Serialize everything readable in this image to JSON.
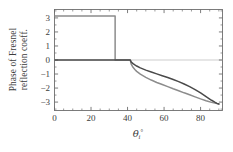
{
  "chart_data": {
    "type": "line",
    "title": "",
    "xlabel": "θᵢ°",
    "ylabel": "Phase of Fresnel reflection coeff.",
    "xlabel_parts": {
      "symbol": "θ",
      "subscript": "i",
      "superscript": "°"
    },
    "ylabel_line1": "Phase of Fresnel",
    "ylabel_line2": "reflection coeff.",
    "xlim": [
      0,
      92
    ],
    "ylim": [
      -3.6,
      3.6
    ],
    "xticks": [
      0,
      20,
      40,
      60,
      80
    ],
    "xtick_labels": [
      "0",
      "20",
      "40",
      "60",
      "80"
    ],
    "xticks_minor": [
      5,
      10,
      15,
      25,
      30,
      35,
      45,
      50,
      55,
      65,
      70,
      75,
      85,
      90
    ],
    "yticks": [
      3,
      2,
      1,
      0,
      -1,
      -2,
      -3
    ],
    "ytick_labels": [
      "3",
      "2",
      "1",
      "0",
      "−1",
      "−2",
      "−3"
    ],
    "yticks_minor": [
      3.5,
      2.5,
      1.5,
      0.5,
      -0.5,
      -1.5,
      -2.5,
      -3.5
    ],
    "grid": false,
    "frame": true,
    "legend": null,
    "zero_line": 0,
    "brewster_angle": 33.2,
    "critical_angle": 41.5,
    "series": [
      {
        "name": "s-polarization phase (step)",
        "color": "#8c8c8c",
        "width": 1.5,
        "points": [
          [
            0,
            3.1416
          ],
          [
            33.2,
            3.1416
          ],
          [
            33.2,
            0
          ],
          [
            41.5,
            0
          ],
          [
            42,
            -0.3
          ],
          [
            43,
            -0.52
          ],
          [
            44,
            -0.68
          ],
          [
            45,
            -0.81
          ],
          [
            47,
            -1.01
          ],
          [
            50,
            -1.24
          ],
          [
            53,
            -1.43
          ],
          [
            56,
            -1.6
          ],
          [
            59,
            -1.75
          ],
          [
            62,
            -1.9
          ],
          [
            65,
            -2.05
          ],
          [
            68,
            -2.19
          ],
          [
            71,
            -2.34
          ],
          [
            74,
            -2.48
          ],
          [
            77,
            -2.63
          ],
          [
            80,
            -2.77
          ],
          [
            83,
            -2.9
          ],
          [
            86,
            -3.02
          ],
          [
            89,
            -3.11
          ],
          [
            90,
            -3.1416
          ]
        ]
      },
      {
        "name": "p-polarization phase",
        "color": "#4a4a4a",
        "width": 1.5,
        "points": [
          [
            0,
            0
          ],
          [
            20,
            0
          ],
          [
            33.2,
            0
          ],
          [
            41.5,
            0
          ],
          [
            42,
            -0.14
          ],
          [
            43,
            -0.26
          ],
          [
            44,
            -0.35
          ],
          [
            45,
            -0.43
          ],
          [
            47,
            -0.56
          ],
          [
            50,
            -0.72
          ],
          [
            53,
            -0.86
          ],
          [
            56,
            -0.99
          ],
          [
            59,
            -1.12
          ],
          [
            62,
            -1.25
          ],
          [
            65,
            -1.39
          ],
          [
            68,
            -1.54
          ],
          [
            71,
            -1.71
          ],
          [
            74,
            -1.9
          ],
          [
            77,
            -2.11
          ],
          [
            80,
            -2.35
          ],
          [
            83,
            -2.61
          ],
          [
            86,
            -2.87
          ],
          [
            88,
            -3.02
          ],
          [
            89,
            -3.09
          ],
          [
            90,
            -3.1416
          ]
        ]
      }
    ],
    "colors": {
      "curve_dark": "#4a4a4a",
      "curve_light": "#8c8c8c",
      "axis": "#6e6e6e",
      "zero_line": "#b8b8b8",
      "text": "#3c3c3c",
      "background": "#ffffff"
    }
  }
}
